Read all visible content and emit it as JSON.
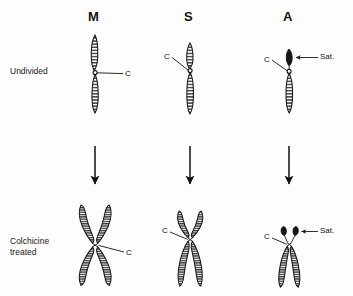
{
  "figure": {
    "background_color": "#fdfdfd",
    "ink_color": "#111111"
  },
  "columns": [
    {
      "key": "M",
      "label": "M",
      "name": "metacentric",
      "x": 95
    },
    {
      "key": "S",
      "label": "S",
      "name": "submetacentric",
      "x": 190
    },
    {
      "key": "A",
      "label": "A",
      "name": "acrocentric",
      "x": 289
    }
  ],
  "rows": [
    {
      "key": "undivided",
      "label": "Undivided",
      "y": 70
    },
    {
      "key": "colchicine",
      "label": "Colchicine\ntreated",
      "y": 240
    }
  ],
  "annotations": {
    "centromere": "C",
    "satellite": "Sat."
  },
  "labels": {
    "m_undivided_c": "C",
    "s_undivided_c": "C",
    "a_undivided_c": "C",
    "a_undivided_sat": "Sat.",
    "m_treated_c": "C",
    "s_treated_c": "C",
    "a_treated_c": "C",
    "a_treated_sat": "Sat."
  },
  "arrows": {
    "count": 3,
    "direction": "down",
    "x_positions": [
      95,
      190,
      289
    ],
    "y_top": 145,
    "y_bottom": 185
  }
}
